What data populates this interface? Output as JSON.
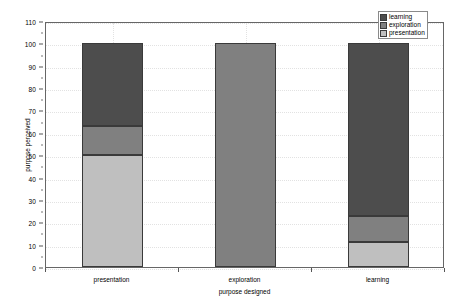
{
  "chart_data": {
    "type": "bar",
    "stacked": true,
    "title": "",
    "xlabel": "purpose designed",
    "ylabel": "purpose perceived",
    "categories": [
      "presentation",
      "exploration",
      "learning"
    ],
    "ylim": [
      0,
      110
    ],
    "yticks": [
      0,
      10,
      20,
      30,
      40,
      50,
      60,
      70,
      80,
      90,
      100,
      110
    ],
    "ytick_labels": [
      "0",
      "10",
      "20",
      "30",
      "40",
      "50",
      "60",
      "70",
      "80",
      "90",
      "100",
      "110"
    ],
    "grid": true,
    "legend_position": "top-right",
    "series": [
      {
        "name": "presentation",
        "color": "#bfbfbf",
        "values": [
          50,
          0,
          11
        ]
      },
      {
        "name": "exploration",
        "color": "#808080",
        "values": [
          13,
          100,
          12
        ]
      },
      {
        "name": "learning",
        "color": "#4d4d4d",
        "values": [
          37,
          0,
          77
        ]
      }
    ],
    "stack_order_bottom_to_top": [
      "presentation",
      "exploration",
      "learning"
    ],
    "legend_order_top_to_bottom": [
      "learning",
      "exploration",
      "presentation"
    ],
    "bar_totals": [
      100,
      100,
      100
    ]
  },
  "colors": {
    "learning": "#4d4d4d",
    "exploration": "#808080",
    "presentation": "#bfbfbf",
    "bar_border": "#3a3a3a",
    "plot_border": "#666666",
    "grid": "#e2e2e2",
    "background": "#ffffff",
    "text": "#000000"
  },
  "legend": {
    "items": [
      {
        "label": "learning",
        "color": "#4d4d4d"
      },
      {
        "label": "exploration",
        "color": "#808080"
      },
      {
        "label": "presentation",
        "color": "#bfbfbf"
      }
    ]
  }
}
